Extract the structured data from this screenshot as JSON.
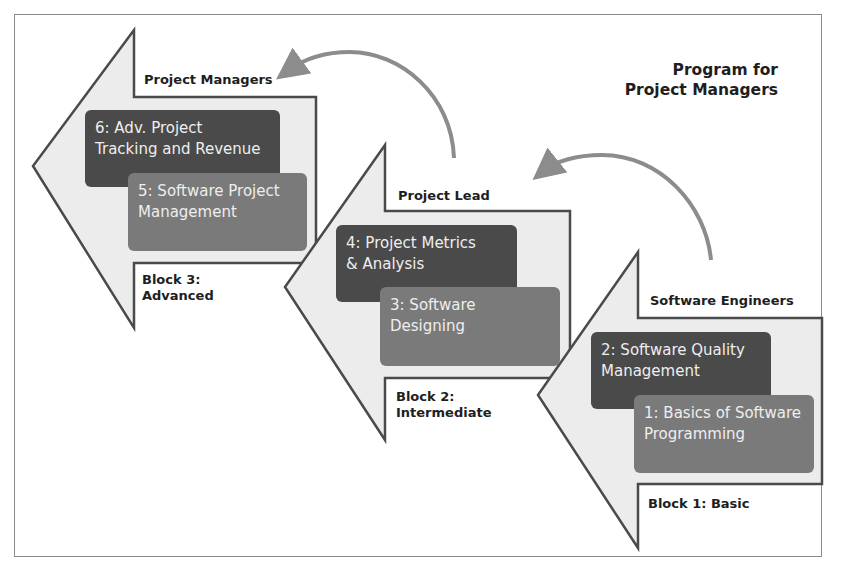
{
  "title": {
    "line1": "Program for",
    "line2": "Project Managers"
  },
  "colors": {
    "arrow_fill": "#ececec",
    "arrow_stroke": "#4a4a4a",
    "dark_box": "#4a4a4a",
    "mid_box": "#7a7a7a",
    "curved_arrow": "#8c8c8c"
  },
  "blocks": [
    {
      "role": "Software Engineers",
      "block_line1": "Block 1: Basic",
      "block_line2": "",
      "courses": [
        {
          "line1": "2: Software Quality",
          "line2": "Management"
        },
        {
          "line1": "1: Basics of Software",
          "line2": "Programming"
        }
      ]
    },
    {
      "role": "Project Lead",
      "block_line1": "Block 2:",
      "block_line2": "Intermediate",
      "courses": [
        {
          "line1": "4: Project Metrics",
          "line2": "& Analysis"
        },
        {
          "line1": "3: Software",
          "line2": "Designing"
        }
      ]
    },
    {
      "role": "Project Managers",
      "block_line1": "Block 3:",
      "block_line2": "Advanced",
      "courses": [
        {
          "line1": "6: Adv. Project",
          "line2": "Tracking and Revenue"
        },
        {
          "line1": "5: Software Project",
          "line2": "Management"
        }
      ]
    }
  ]
}
